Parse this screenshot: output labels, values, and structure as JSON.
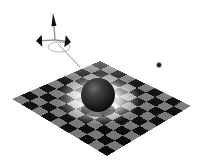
{
  "viewport": {
    "name": "3d-render-viewport",
    "width": 198,
    "height": 167,
    "background_color": "#ffffff",
    "title": "3D raytraced scene: checkerboard plane with sphere",
    "renderer_note": "grayscale raytrace"
  },
  "scene": {
    "ground_plane": {
      "label": "checkerboard-ground-plane",
      "shape": "diamond",
      "corners": {
        "top": [
          100,
          61
        ],
        "right": [
          191,
          106
        ],
        "bottom": [
          107,
          156
        ],
        "left": [
          12,
          99
        ]
      },
      "tiles_u": 10,
      "tiles_v": 10,
      "color_dark": "#0a0a0a",
      "color_light": "#e8e8e8",
      "color_mid": "#8a8a8a"
    },
    "sphere": {
      "label": "dark-sphere",
      "center": [
        98,
        95
      ],
      "radius": 17,
      "color_base": "#2a2a2a",
      "color_highlight": "#6e6e6e",
      "color_shadow": "#050505"
    },
    "light_pool": {
      "label": "caustic-light-pool",
      "center": [
        99,
        99
      ],
      "radius_x": 42,
      "radius_y": 26,
      "color": "#ffffff"
    },
    "light_marker": {
      "label": "point-light-marker",
      "center": [
        159,
        65
      ],
      "radius": 3,
      "color": "#1c1c1c"
    },
    "axis_gizmo": {
      "label": "axis-manipulator-gizmo",
      "origin": [
        55,
        40
      ],
      "stroke_color": "#8c8c8c",
      "cone_color": "#101010",
      "axes": [
        {
          "name": "axis-y-up",
          "tip": [
            53,
            13
          ],
          "cone_w": 5,
          "cone_h": 13
        },
        {
          "name": "axis-x-left",
          "tip": [
            36,
            41
          ],
          "cone_w": 12,
          "cone_h": 6
        },
        {
          "name": "axis-z-right",
          "tip": [
            71,
            42
          ],
          "cone_w": 12,
          "cone_h": 6
        }
      ],
      "tether_line": {
        "name": "gizmo-tether-line",
        "from": [
          58,
          44
        ],
        "to": [
          80,
          67
        ]
      },
      "ring": {
        "name": "gizmo-rotation-ring",
        "center": [
          59,
          47
        ],
        "rx": 11,
        "ry": 5
      }
    }
  },
  "a11y": {
    "viewport_alt": "Grayscale 3D render of a dark sphere resting on an infinite checkerboard plane, with a coordinate axis gizmo above left and a point light marker at upper right."
  }
}
